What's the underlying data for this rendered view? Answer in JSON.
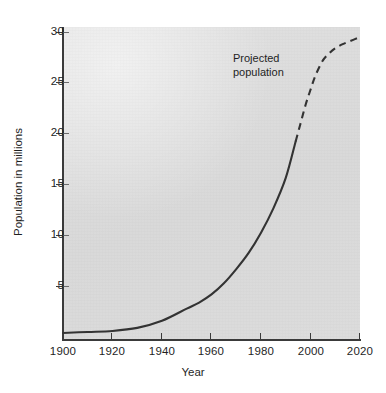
{
  "chart_data": {
    "type": "line",
    "title": "",
    "subtitle": "",
    "xlabel": "Year",
    "ylabel": "Population in millions",
    "xlim": [
      1900,
      2020
    ],
    "ylim": [
      0,
      30
    ],
    "grid": false,
    "legend_position": "none",
    "background_color": "#dedede",
    "line_color": "#333333",
    "x_ticks": [
      1900,
      1920,
      1940,
      1960,
      1980,
      2000,
      2020
    ],
    "y_ticks": [
      5,
      10,
      15,
      20,
      25,
      30
    ],
    "annotations": [
      {
        "id": "projected-population",
        "line1": "Projected",
        "line2": "population",
        "text": "Projected population",
        "x": 1969,
        "y": 27.6
      }
    ],
    "series": [
      {
        "name": "Observed population",
        "style": "solid",
        "x": [
          1900,
          1910,
          1920,
          1930,
          1940,
          1950,
          1955,
          1960,
          1965,
          1970,
          1975,
          1980,
          1985,
          1990,
          1994
        ],
        "values": [
          0.3,
          0.4,
          0.5,
          0.8,
          1.5,
          2.7,
          3.3,
          4.1,
          5.2,
          6.6,
          8.2,
          10.2,
          12.6,
          15.6,
          19.2
        ]
      },
      {
        "name": "Projected population",
        "style": "dashed",
        "x": [
          1994,
          1996,
          1998,
          2000,
          2002,
          2005,
          2008,
          2010,
          2013,
          2016,
          2020
        ],
        "values": [
          19.2,
          21.0,
          22.8,
          24.3,
          25.7,
          27.2,
          28.0,
          28.4,
          28.8,
          29.1,
          29.5
        ]
      }
    ]
  },
  "figure": {
    "y_tick_labels": [
      "30",
      "25",
      "20",
      "15",
      "10",
      "5"
    ],
    "x_tick_labels": [
      "1900",
      "1920",
      "1940",
      "1960",
      "1980",
      "2000",
      "2020"
    ],
    "x_axis_title": "Year",
    "y_axis_title": "Population in millions",
    "annotation_line1": "Projected",
    "annotation_line2": "population"
  }
}
